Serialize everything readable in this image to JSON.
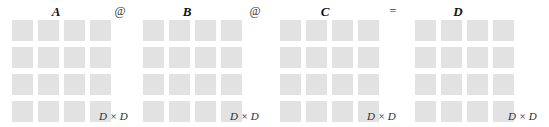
{
  "figure": {
    "width": 549,
    "height": 127,
    "background_color": "#ffffff",
    "cell_color": "#e2e2e2",
    "label_color": "#111111",
    "operator_color": "#333333"
  },
  "matrices": [
    {
      "label": "A",
      "dimension_label": "D × D",
      "rows": 4,
      "cols": 4,
      "left": 12,
      "label_left": 46,
      "dim_left": 99
    },
    {
      "label": "B",
      "dimension_label": "D × D",
      "rows": 4,
      "cols": 4,
      "left": 143,
      "label_left": 177,
      "dim_left": 230
    },
    {
      "label": "C",
      "dimension_label": "D × D",
      "rows": 4,
      "cols": 4,
      "left": 280,
      "label_left": 315,
      "dim_left": 367
    },
    {
      "label": "D",
      "dimension_label": "D × D",
      "rows": 4,
      "cols": 4,
      "left": 415,
      "label_left": 448,
      "dim_left": 508
    }
  ],
  "operators": [
    {
      "symbol": "@",
      "name": "matmul-operator",
      "left": 111
    },
    {
      "symbol": "@",
      "name": "matmul-operator",
      "left": 246
    },
    {
      "symbol": "=",
      "name": "equals-operator",
      "left": 384
    }
  ]
}
